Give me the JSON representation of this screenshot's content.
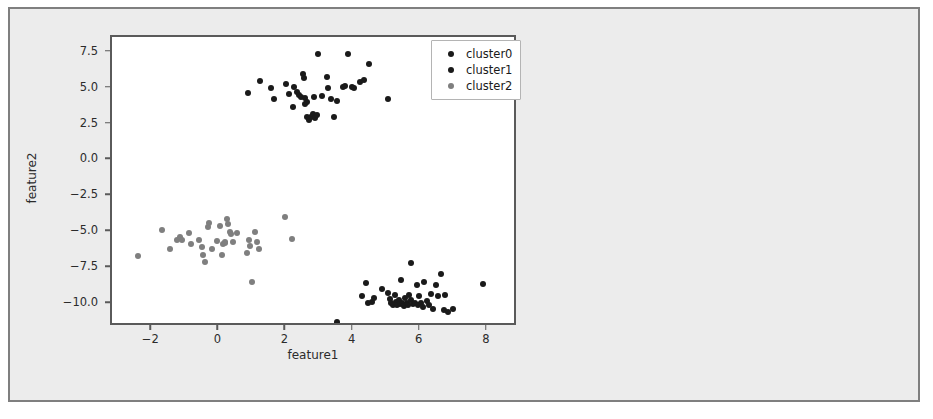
{
  "chart_data": {
    "type": "scatter",
    "title": "",
    "xlabel": "feature1",
    "ylabel": "feature2",
    "xlim": [
      -3.2,
      8.9
    ],
    "ylim": [
      -11.6,
      8.6
    ],
    "xticks": [
      -2,
      0,
      2,
      4,
      6,
      8
    ],
    "xtick_labels": [
      "−2",
      "0",
      "2",
      "4",
      "6",
      "8"
    ],
    "yticks": [
      7.5,
      5.0,
      2.5,
      0.0,
      -2.5,
      -5.0,
      -7.5,
      -10.0
    ],
    "ytick_labels": [
      "7.5",
      "5.0",
      "2.5",
      "0.0",
      "−2.5",
      "−5.0",
      "−7.5",
      "−10.0"
    ],
    "grid": false,
    "legend_position": "upper right",
    "marker_size": 6,
    "series": [
      {
        "name": "cluster0",
        "color": "#1a1a1a",
        "points": [
          [
            0.86,
            4.72
          ],
          [
            1.22,
            5.55
          ],
          [
            1.55,
            5.05
          ],
          [
            1.62,
            4.25
          ],
          [
            2.0,
            5.3
          ],
          [
            2.08,
            4.6
          ],
          [
            2.18,
            3.7
          ],
          [
            2.22,
            5.15
          ],
          [
            2.3,
            4.78
          ],
          [
            2.36,
            4.55
          ],
          [
            2.44,
            4.4
          ],
          [
            2.5,
            6.0
          ],
          [
            2.52,
            5.72
          ],
          [
            2.55,
            4.35
          ],
          [
            2.56,
            3.95
          ],
          [
            2.6,
            4.1
          ],
          [
            2.62,
            3.05
          ],
          [
            2.66,
            2.85
          ],
          [
            2.72,
            3.0
          ],
          [
            2.78,
            3.25
          ],
          [
            2.82,
            4.45
          ],
          [
            2.86,
            2.95
          ],
          [
            2.9,
            3.2
          ],
          [
            2.95,
            7.45
          ],
          [
            3.05,
            4.48
          ],
          [
            3.2,
            5.8
          ],
          [
            3.25,
            5.05
          ],
          [
            3.32,
            4.25
          ],
          [
            3.42,
            3.05
          ],
          [
            3.5,
            4.15
          ],
          [
            3.68,
            5.1
          ],
          [
            3.75,
            5.2
          ],
          [
            3.82,
            7.45
          ],
          [
            3.95,
            5.15
          ],
          [
            4.02,
            5.05
          ],
          [
            4.18,
            5.5
          ],
          [
            4.3,
            5.6
          ],
          [
            4.45,
            6.75
          ],
          [
            5.02,
            4.25
          ]
        ]
      },
      {
        "name": "cluster1",
        "color": "#1a1a1a",
        "points": [
          [
            3.52,
            -11.25
          ],
          [
            4.24,
            -9.45
          ],
          [
            4.36,
            -8.55
          ],
          [
            4.42,
            -9.9
          ],
          [
            4.55,
            -9.85
          ],
          [
            4.6,
            -9.55
          ],
          [
            4.85,
            -8.95
          ],
          [
            5.02,
            -9.25
          ],
          [
            5.08,
            -9.65
          ],
          [
            5.12,
            -9.9
          ],
          [
            5.18,
            -10.05
          ],
          [
            5.22,
            -9.4
          ],
          [
            5.25,
            -9.85
          ],
          [
            5.3,
            -10.1
          ],
          [
            5.35,
            -9.7
          ],
          [
            5.38,
            -10.0
          ],
          [
            5.42,
            -8.35
          ],
          [
            5.45,
            -9.95
          ],
          [
            5.5,
            -10.15
          ],
          [
            5.52,
            -9.55
          ],
          [
            5.58,
            -9.9
          ],
          [
            5.62,
            -10.05
          ],
          [
            5.65,
            -9.35
          ],
          [
            5.7,
            -7.15
          ],
          [
            5.72,
            -9.75
          ],
          [
            5.78,
            -10.0
          ],
          [
            5.82,
            -9.9
          ],
          [
            5.88,
            -8.7
          ],
          [
            5.92,
            -10.1
          ],
          [
            5.95,
            -9.45
          ],
          [
            6.02,
            -9.95
          ],
          [
            6.08,
            -10.2
          ],
          [
            6.1,
            -8.45
          ],
          [
            6.18,
            -9.8
          ],
          [
            6.25,
            -10.05
          ],
          [
            6.32,
            -9.3
          ],
          [
            6.38,
            -10.35
          ],
          [
            6.45,
            -8.7
          ],
          [
            6.52,
            -9.45
          ],
          [
            6.6,
            -7.9
          ],
          [
            6.68,
            -10.4
          ],
          [
            6.72,
            -9.35
          ],
          [
            6.8,
            -10.55
          ],
          [
            6.95,
            -10.35
          ],
          [
            7.85,
            -8.6
          ]
        ]
      },
      {
        "name": "cluster2",
        "color": "#7f7f7f",
        "points": [
          [
            -2.42,
            -6.65
          ],
          [
            -1.72,
            -4.85
          ],
          [
            -1.48,
            -6.15
          ],
          [
            -1.25,
            -5.55
          ],
          [
            -1.18,
            -5.35
          ],
          [
            -1.12,
            -5.55
          ],
          [
            -0.92,
            -5.05
          ],
          [
            -0.86,
            -5.8
          ],
          [
            -0.62,
            -5.55
          ],
          [
            -0.52,
            -6.05
          ],
          [
            -0.48,
            -6.55
          ],
          [
            -0.42,
            -7.05
          ],
          [
            -0.35,
            -4.65
          ],
          [
            -0.32,
            -4.35
          ],
          [
            -0.22,
            -6.15
          ],
          [
            -0.08,
            -5.6
          ],
          [
            0.02,
            -4.55
          ],
          [
            0.08,
            -6.55
          ],
          [
            0.12,
            -5.85
          ],
          [
            0.16,
            -5.75
          ],
          [
            0.18,
            -5.7
          ],
          [
            0.22,
            -4.05
          ],
          [
            0.26,
            -4.45
          ],
          [
            0.32,
            -4.95
          ],
          [
            0.36,
            -5.15
          ],
          [
            0.42,
            -5.65
          ],
          [
            0.52,
            -5.05
          ],
          [
            0.82,
            -6.45
          ],
          [
            0.88,
            -5.55
          ],
          [
            0.92,
            -5.95
          ],
          [
            0.98,
            -8.45
          ],
          [
            1.05,
            -4.95
          ],
          [
            1.12,
            -5.65
          ],
          [
            1.18,
            -6.15
          ],
          [
            1.95,
            -3.95
          ],
          [
            2.15,
            -5.45
          ]
        ]
      }
    ]
  },
  "legend": {
    "entries": [
      {
        "label": "cluster0",
        "color": "#1a1a1a"
      },
      {
        "label": "cluster1",
        "color": "#1a1a1a"
      },
      {
        "label": "cluster2",
        "color": "#7f7f7f"
      }
    ]
  },
  "colors": {
    "figure_background": "#ececec",
    "axes_background": "#ffffff",
    "page_background": "#ffffff",
    "frame_border": "#7f7f7f",
    "axes_border": "#5a5a5a",
    "text": "#2b2b2b"
  }
}
